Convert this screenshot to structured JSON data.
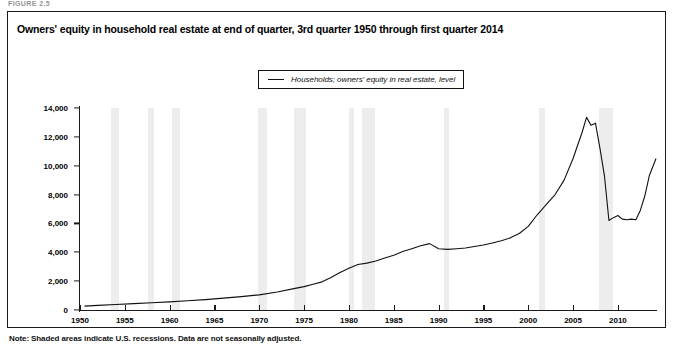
{
  "figure_label": "FIGURE 2.5",
  "title": "Owners' equity in household real estate at end of quarter, 3rd quarter 1950 through first quarter 2014",
  "legend": {
    "entries": [
      {
        "label": "Households; owners' equity in real estate, level",
        "color": "#111111",
        "marker": "line-swatch"
      }
    ]
  },
  "note": "Note: Shaded areas indicate U.S. recessions. Data are not seasonally adjusted.",
  "axes": {
    "y_title": "Billions of dollars",
    "y_ticks": [
      "0",
      "2,000",
      "4,000",
      "6,000",
      "8,000",
      "10,000",
      "12,000",
      "14,000"
    ],
    "x_ticks": [
      "1950",
      "1955",
      "1960",
      "1965",
      "1970",
      "1975",
      "1980",
      "1985",
      "1990",
      "1995",
      "2000",
      "2005",
      "2010"
    ]
  },
  "chart_data": {
    "type": "line",
    "title": "Owners' equity in household real estate at end of quarter, 3rd quarter 1950 through first quarter 2014",
    "xlabel": "",
    "ylabel": "Billions of dollars",
    "xlim": [
      1950,
      2014.25
    ],
    "ylim": [
      0,
      14000
    ],
    "ytick_values": [
      0,
      2000,
      4000,
      6000,
      8000,
      10000,
      12000,
      14000
    ],
    "xtick_values": [
      1950,
      1955,
      1960,
      1965,
      1970,
      1975,
      1980,
      1985,
      1990,
      1995,
      2000,
      2005,
      2010
    ],
    "grid": false,
    "legend_position": "top-center",
    "series": [
      {
        "name": "Households; owners' equity in real estate, level",
        "color": "#111111",
        "x": [
          1950.5,
          1952,
          1954,
          1956,
          1958,
          1960,
          1962,
          1964,
          1966,
          1968,
          1970,
          1972,
          1974,
          1975,
          1976,
          1977,
          1978,
          1979,
          1980,
          1981,
          1982,
          1983,
          1984,
          1985,
          1986,
          1987,
          1988,
          1989,
          1990,
          1991,
          1992,
          1993,
          1994,
          1995,
          1996,
          1997,
          1998,
          1999,
          2000,
          2001,
          2002,
          2003,
          2004,
          2005,
          2006,
          2006.5,
          2007,
          2007.5,
          2008,
          2008.5,
          2009,
          2009.5,
          2010,
          2010.5,
          2011,
          2011.5,
          2012,
          2012.5,
          2013,
          2013.5,
          2014.25
        ],
        "y": [
          270,
          320,
          380,
          440,
          500,
          560,
          640,
          720,
          820,
          930,
          1050,
          1250,
          1500,
          1620,
          1780,
          1950,
          2250,
          2600,
          2900,
          3150,
          3250,
          3400,
          3600,
          3800,
          4050,
          4250,
          4450,
          4600,
          4250,
          4200,
          4250,
          4300,
          4400,
          4500,
          4650,
          4800,
          5000,
          5300,
          5800,
          6600,
          7300,
          8000,
          9000,
          10500,
          12300,
          13350,
          12800,
          12950,
          11200,
          9300,
          6200,
          6400,
          6550,
          6300,
          6250,
          6300,
          6250,
          6900,
          7900,
          9300,
          10500
        ]
      }
    ],
    "recessions": [
      {
        "start": 1953.5,
        "end": 1954.4
      },
      {
        "start": 1957.6,
        "end": 1958.3
      },
      {
        "start": 1960.3,
        "end": 1961.1
      },
      {
        "start": 1969.9,
        "end": 1970.9
      },
      {
        "start": 1973.9,
        "end": 1975.2
      },
      {
        "start": 1980.0,
        "end": 1980.6
      },
      {
        "start": 1981.5,
        "end": 1982.9
      },
      {
        "start": 1990.6,
        "end": 1991.2
      },
      {
        "start": 2001.2,
        "end": 2001.9
      },
      {
        "start": 2007.9,
        "end": 2009.5
      }
    ],
    "recession_color": "#ededed",
    "annotations": [
      {
        "text": "peak ~13,400 in 2006",
        "x": 2006.5,
        "y": 13350
      },
      {
        "text": "trough ~6,200 in 2009",
        "x": 2009,
        "y": 6200
      }
    ]
  }
}
